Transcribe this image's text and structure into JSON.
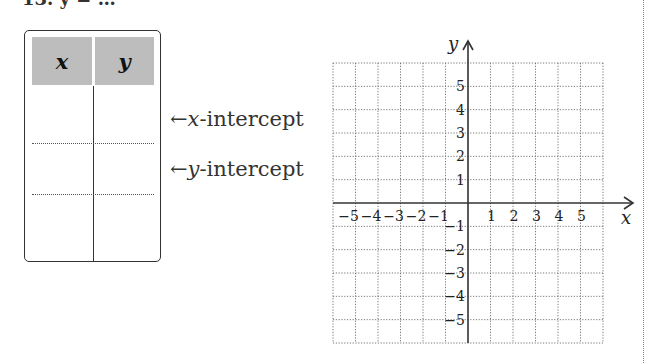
{
  "problem": {
    "cut_label": "13. y = …"
  },
  "table": {
    "headers": [
      "x",
      "y"
    ],
    "rows": [
      [
        "",
        ""
      ],
      [
        "",
        ""
      ],
      [
        "",
        ""
      ]
    ],
    "row_labels": [
      {
        "arrow": "←",
        "var": "x",
        "text": "-intercept"
      },
      {
        "arrow": "←",
        "var": "y",
        "text": "-intercept"
      }
    ],
    "header_color": "#bdbdbd"
  },
  "chart_data": {
    "type": "scatter",
    "title": "",
    "xlabel": "x",
    "ylabel": "y",
    "xlim": [
      -6,
      6
    ],
    "ylim": [
      -6,
      6
    ],
    "grid": true,
    "x_ticks": [
      -5,
      -4,
      -3,
      -2,
      -1,
      1,
      2,
      3,
      4,
      5
    ],
    "y_ticks": [
      -5,
      -4,
      -3,
      -2,
      -1,
      1,
      2,
      3,
      4,
      5
    ],
    "x_tick_labels": [
      "−5",
      "−4",
      "−3",
      "−2",
      "−1",
      "1",
      "2",
      "3",
      "4",
      "5"
    ],
    "y_tick_labels": [
      "−5",
      "−4",
      "−3",
      "−2",
      "−1",
      "1",
      "2",
      "3",
      "4",
      "5"
    ],
    "series": []
  }
}
